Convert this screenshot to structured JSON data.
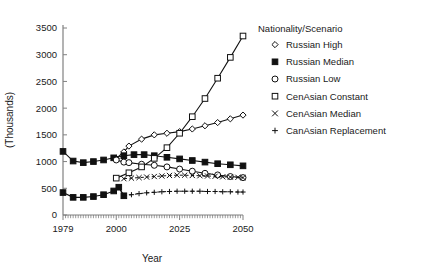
{
  "chart_data": {
    "type": "line",
    "title": "",
    "xlabel": "Year",
    "ylabel": "(Thousands)",
    "xlim": [
      1979,
      2050
    ],
    "ylim": [
      0,
      3500
    ],
    "xticks": [
      1979,
      2000,
      2025,
      2050
    ],
    "yticks": [
      0,
      500,
      1000,
      1500,
      2000,
      2500,
      3000,
      3500
    ],
    "grid": false,
    "legend_title": "Nationality/Scenario",
    "legend_position": "right",
    "series": [
      {
        "name": "Russian High",
        "marker": "diamond-open",
        "x": [
          2000,
          2003,
          2005,
          2010,
          2015,
          2020,
          2025,
          2030,
          2035,
          2040,
          2045,
          2050
        ],
        "values": [
          1060,
          1180,
          1290,
          1420,
          1500,
          1530,
          1560,
          1610,
          1670,
          1730,
          1800,
          1870
        ]
      },
      {
        "name": "Russian Median",
        "marker": "square-filled",
        "x": [
          1979,
          1983,
          1987,
          1991,
          1995,
          1999,
          2003,
          2007,
          2011,
          2015,
          2020,
          2025,
          2030,
          2035,
          2040,
          2045,
          2050
        ],
        "values": [
          1190,
          1010,
          980,
          1000,
          1030,
          1070,
          1110,
          1130,
          1130,
          1110,
          1080,
          1050,
          1020,
          990,
          960,
          940,
          920
        ]
      },
      {
        "name": "Russian Low",
        "marker": "circle-open",
        "x": [
          2000,
          2003,
          2005,
          2010,
          2015,
          2020,
          2025,
          2030,
          2035,
          2040,
          2045,
          2050
        ],
        "values": [
          1030,
          990,
          980,
          950,
          930,
          900,
          860,
          820,
          780,
          750,
          720,
          700
        ]
      },
      {
        "name": "CenAsian Constant",
        "marker": "square-open",
        "x": [
          2000,
          2005,
          2010,
          2015,
          2020,
          2025,
          2030,
          2035,
          2040,
          2045,
          2050
        ],
        "values": [
          690,
          790,
          900,
          1060,
          1260,
          1530,
          1840,
          2180,
          2560,
          2950,
          3350
        ]
      },
      {
        "name": "CenAsian Median",
        "marker": "cross",
        "x": [
          2003,
          2006,
          2009,
          2012,
          2015,
          2018,
          2021,
          2024,
          2027,
          2030,
          2033,
          2036,
          2039,
          2042,
          2045,
          2048,
          2050
        ],
        "values": [
          680,
          690,
          700,
          710,
          720,
          730,
          740,
          745,
          745,
          740,
          735,
          730,
          725,
          715,
          710,
          705,
          700
        ]
      },
      {
        "name": "CanAsian Replacement",
        "marker": "plus",
        "x": [
          2003,
          2006,
          2009,
          2012,
          2015,
          2018,
          2021,
          2024,
          2027,
          2030,
          2033,
          2036,
          2039,
          2042,
          2045,
          2048,
          2050
        ],
        "values": [
          360,
          380,
          400,
          415,
          425,
          435,
          440,
          445,
          445,
          445,
          445,
          440,
          440,
          435,
          435,
          430,
          430
        ]
      },
      {
        "name": "CenAsian Historical",
        "marker": "square-filled",
        "x": [
          1979,
          1983,
          1987,
          1991,
          1995,
          1999,
          2001,
          2003
        ],
        "values": [
          420,
          330,
          330,
          345,
          380,
          450,
          520,
          360
        ]
      }
    ]
  },
  "axes": {
    "x_tick_labels": [
      "1979",
      "2000",
      "2025",
      "2050"
    ],
    "y_tick_labels": [
      "0",
      "500",
      "1000",
      "1500",
      "2000",
      "2500",
      "3000",
      "3500"
    ],
    "x_axis_title": "Year",
    "y_axis_title": "(Thousands)"
  },
  "legend": {
    "title": "Nationality/Scenario",
    "items": [
      {
        "label": "Russian High",
        "marker": "diamond-open"
      },
      {
        "label": "Russian Median",
        "marker": "square-filled"
      },
      {
        "label": "Russian Low",
        "marker": "circle-open"
      },
      {
        "label": "CenAsian Constant",
        "marker": "square-open"
      },
      {
        "label": "CenAsian Median",
        "marker": "cross"
      },
      {
        "label": "CanAsian Replacement",
        "marker": "plus"
      }
    ]
  },
  "colors": {
    "ink": "#111111",
    "axis": "#808080",
    "background": "#ffffff"
  }
}
